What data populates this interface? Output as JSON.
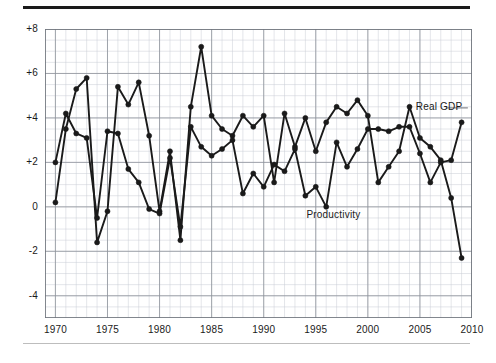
{
  "figure": {
    "top_rule_color": "#1a1a1a",
    "bottom_rule_color": "#bdbdbd",
    "background": "#ffffff"
  },
  "axes": {
    "y_tick_labels": [
      "+8",
      "+6",
      "+4",
      "+2",
      "0",
      "-2",
      "-4"
    ],
    "x_tick_labels": [
      "1970",
      "1975",
      "1980",
      "1985",
      "1990",
      "1995",
      "2000",
      "2005",
      "2010"
    ]
  },
  "annotations": [
    {
      "name": "real-gdp-label",
      "text": "Real GDP",
      "x_year": 2004.6,
      "y_value": 4.45
    },
    {
      "name": "productivity-label",
      "text": "Productivity",
      "x_year": 1994.1,
      "y_value": -0.42
    }
  ],
  "chart_data": {
    "type": "line",
    "title": "",
    "subtitle": "",
    "xlabel": "",
    "ylabel": "",
    "xlim": [
      1969,
      2010
    ],
    "ylim": [
      -5,
      8
    ],
    "grid": true,
    "grid_minor_step_x": 1,
    "grid_minor_step_y": 0.5,
    "grid_major_step_x": 5,
    "grid_major_step_y": 2,
    "legend_position": "inline-annotation",
    "line_color": "#1a1a1a",
    "marker": "circle",
    "x": [
      1970,
      1971,
      1972,
      1973,
      1974,
      1975,
      1976,
      1977,
      1978,
      1979,
      1980,
      1981,
      1982,
      1983,
      1984,
      1985,
      1986,
      1987,
      1988,
      1989,
      1990,
      1991,
      1992,
      1993,
      1994,
      1995,
      1996,
      1997,
      1998,
      1999,
      2000,
      2001,
      2002,
      2003,
      2004,
      2005,
      2006,
      2007,
      2008,
      2009
    ],
    "series": [
      {
        "name": "Real GDP",
        "values": [
          0.2,
          3.5,
          5.3,
          5.8,
          -1.6,
          -0.2,
          5.4,
          4.6,
          5.6,
          3.2,
          -0.2,
          2.5,
          -1.5,
          4.5,
          7.2,
          4.1,
          3.5,
          3.2,
          4.1,
          3.6,
          4.1,
          1.1,
          4.2,
          2.7,
          4.0,
          2.5,
          3.8,
          4.5,
          4.2,
          4.8,
          4.1,
          1.1,
          1.8,
          2.5,
          4.5,
          3.1,
          2.7,
          2.1,
          0.4,
          -2.3
        ]
      },
      {
        "name": "Productivity",
        "values": [
          2.0,
          4.2,
          3.3,
          3.1,
          -0.5,
          3.4,
          3.3,
          1.7,
          1.1,
          -0.1,
          -0.3,
          2.2,
          -0.9,
          3.6,
          2.7,
          2.3,
          2.6,
          3.0,
          0.6,
          1.5,
          0.9,
          1.9,
          1.6,
          2.6,
          0.5,
          0.9,
          0.0,
          2.9,
          1.8,
          2.6,
          3.5,
          3.5,
          3.4,
          3.6,
          3.6,
          2.4,
          1.1,
          2.0,
          2.1,
          3.8
        ]
      }
    ]
  }
}
